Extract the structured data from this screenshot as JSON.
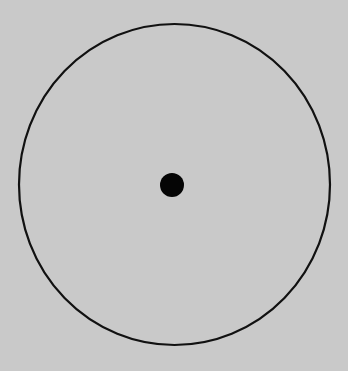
{
  "figure": {
    "width": 348,
    "height": 371,
    "background": "#c9c9c9",
    "circle": {
      "cx": 174.5,
      "cy": 184.5,
      "rx": 155.5,
      "ry": 160.5,
      "stroke": "#111111",
      "stroke_width": 2.2
    },
    "center_dot": {
      "cx": 172,
      "cy": 185,
      "r": 12,
      "fill": "#050505"
    }
  }
}
